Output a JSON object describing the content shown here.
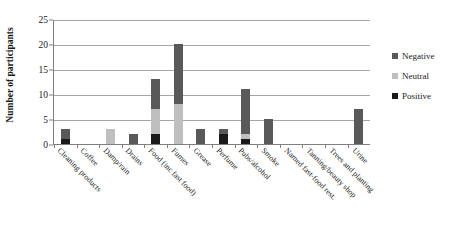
{
  "chart_data": {
    "type": "bar",
    "subtype": "stacked",
    "title": "",
    "xlabel": "",
    "ylabel": "Number of participants",
    "ylim": [
      0,
      25
    ],
    "yticks": [
      0,
      5,
      10,
      15,
      20,
      25
    ],
    "grid": true,
    "legend_position": "right",
    "categories": [
      "Cleaning products",
      "Coffee",
      "Damp/rain",
      "Drains",
      "Food (inc fast food)",
      "Fumes",
      "Grease",
      "Perfume",
      "Pubs/alcohol",
      "Smoke",
      "Named fast-food rest.",
      "Tanning/beauty shop",
      "Trees and planting",
      "Urine"
    ],
    "series": [
      {
        "name": "Positive",
        "color": "#1a1a1a",
        "values": [
          1,
          0,
          0,
          0,
          2,
          0,
          0,
          2,
          1,
          0,
          0,
          0,
          0,
          0
        ]
      },
      {
        "name": "Neutral",
        "color": "#bfbfbf",
        "values": [
          0,
          0,
          3,
          0,
          5,
          8,
          0,
          0,
          1,
          0,
          0,
          0,
          0,
          0
        ]
      },
      {
        "name": "Negative",
        "color": "#595959",
        "values": [
          2,
          0,
          0,
          2,
          6,
          12,
          3,
          1,
          9,
          5,
          0,
          0,
          0,
          7
        ]
      }
    ],
    "totals": [
      3,
      0,
      3,
      2,
      13,
      20,
      3,
      3,
      11,
      5,
      0,
      0,
      0,
      7
    ]
  },
  "legend": {
    "items": [
      {
        "label": "Negative",
        "color": "#595959"
      },
      {
        "label": "Neutral",
        "color": "#bfbfbf"
      },
      {
        "label": "Positive",
        "color": "#1a1a1a"
      }
    ]
  },
  "axes": {
    "y_title": "Number of participants",
    "y_tick_labels": [
      "0",
      "5",
      "10",
      "15",
      "20",
      "25"
    ]
  },
  "colors": {
    "gridline": "#a6a6a6",
    "axis": "#7f7f7f",
    "background": "#ffffff",
    "text": "#1a1a1a"
  }
}
